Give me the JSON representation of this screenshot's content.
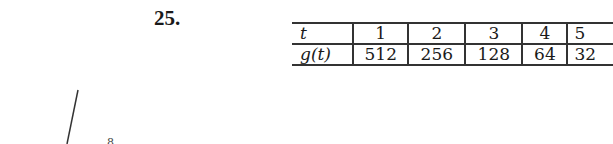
{
  "problem": {
    "number": "25."
  },
  "table": {
    "rows": [
      {
        "label": "t",
        "values": [
          "1",
          "2",
          "3",
          "4",
          "5"
        ]
      },
      {
        "label": "g(t)",
        "values": [
          "512",
          "256",
          "128",
          "64",
          "32"
        ]
      }
    ]
  },
  "sketch": {
    "partial_label": "8"
  }
}
